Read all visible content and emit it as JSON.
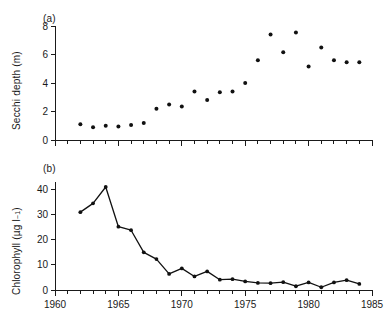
{
  "figure": {
    "background_color": "#ffffff",
    "ink_color": "#111111",
    "panel_a_label": "(a)",
    "panel_b_label": "(b)"
  },
  "chart_data": [
    {
      "type": "scatter",
      "panel": "(a)",
      "title": "",
      "xlabel": "",
      "ylabel": "Secchi depth (m)",
      "xlim": [
        1960,
        1985
      ],
      "ylim": [
        0,
        8
      ],
      "xticks": [
        1960,
        1965,
        1970,
        1975,
        1980,
        1985
      ],
      "xticklabels": [
        "",
        "",
        "",
        "",
        "",
        ""
      ],
      "x_minor_tick_interval": 1,
      "yticks": [
        0,
        2,
        4,
        6,
        8
      ],
      "yticklabels": [
        "0",
        "2",
        "4",
        "6",
        "8"
      ],
      "grid": false,
      "legend": false,
      "marker": "filled-circle",
      "x": [
        1962,
        1963,
        1964,
        1965,
        1966,
        1967,
        1968,
        1969,
        1970,
        1971,
        1972,
        1973,
        1974,
        1975,
        1976,
        1977,
        1978,
        1979,
        1980,
        1981,
        1982,
        1983,
        1984
      ],
      "values": [
        1.1,
        0.9,
        1.0,
        0.95,
        1.05,
        1.2,
        2.2,
        2.5,
        2.35,
        3.4,
        2.8,
        3.35,
        3.4,
        4.0,
        5.6,
        7.4,
        6.15,
        7.55,
        5.15,
        6.5,
        5.6,
        5.45,
        5.45
      ]
    },
    {
      "type": "line",
      "panel": "(b)",
      "title": "",
      "xlabel": "",
      "ylabel": "Chlorophyll (µg l⁻¹)",
      "xlim": [
        1960,
        1985
      ],
      "ylim": [
        0,
        43
      ],
      "xticks": [
        1960,
        1965,
        1970,
        1975,
        1980,
        1985
      ],
      "xticklabels": [
        "1960",
        "1965",
        "1970",
        "1975",
        "1980",
        "1985"
      ],
      "x_minor_tick_interval": 1,
      "yticks": [
        0,
        10,
        20,
        30,
        40
      ],
      "yticklabels": [
        "0",
        "10",
        "20",
        "30",
        "40"
      ],
      "grid": false,
      "legend": false,
      "marker": "filled-circle",
      "x": [
        1962,
        1963,
        1964,
        1965,
        1966,
        1967,
        1968,
        1969,
        1970,
        1971,
        1972,
        1973,
        1974,
        1975,
        1976,
        1977,
        1978,
        1979,
        1980,
        1981,
        1982,
        1983,
        1984
      ],
      "values": [
        31.0,
        34.5,
        41.0,
        25.2,
        23.8,
        15.0,
        12.3,
        6.4,
        8.6,
        5.4,
        7.4,
        4.1,
        4.3,
        3.4,
        2.8,
        2.7,
        3.1,
        1.5,
        3.0,
        1.1,
        3.0,
        3.9,
        2.4
      ]
    }
  ],
  "axis_labels": {
    "secchi": "Secchi depth (m)",
    "chlorophyll_prefix": "Chlorophyll (µg l",
    "chlorophyll_exponent": "−1",
    "chlorophyll_suffix": ")"
  }
}
